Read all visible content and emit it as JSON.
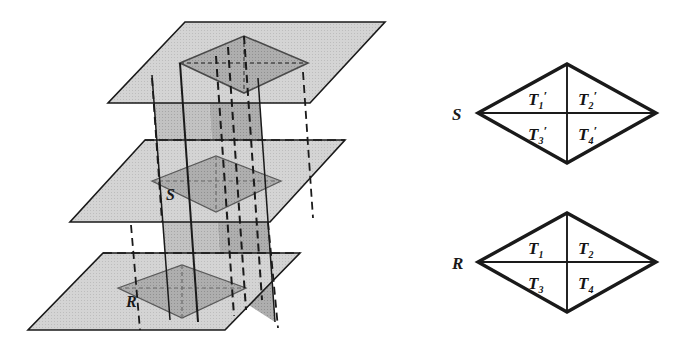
{
  "figure": {
    "colors": {
      "ink": "#1a1a1a",
      "plane_fill": "#d2d2d2",
      "prism_front_fill": "#b4b4b4",
      "prism_side_fill": "#c0c0c0",
      "rhombus_fill": "#a8a8a8",
      "rhombus_fill_dark": "#9a9a9a",
      "background": "#ffffff"
    }
  },
  "left_diagram": {
    "name": "three-parallel-planes-prism",
    "plane_labels": {
      "middle_plane_section": "S",
      "bottom_plane_section": "R"
    },
    "planes": [
      {
        "id": "top-plane",
        "label": ""
      },
      {
        "id": "middle-plane",
        "label": "S"
      },
      {
        "id": "bottom-plane",
        "label": "R"
      }
    ]
  },
  "right_diagrams": [
    {
      "name": "rhombus-s-detail",
      "vertex_label": "S",
      "regions": [
        {
          "id": "t1p",
          "base": "T",
          "sub": "1",
          "prime": "′",
          "quadrant": "top-left"
        },
        {
          "id": "t2p",
          "base": "T",
          "sub": "2",
          "prime": "′",
          "quadrant": "top-right"
        },
        {
          "id": "t3p",
          "base": "T",
          "sub": "3",
          "prime": "′",
          "quadrant": "bottom-left"
        },
        {
          "id": "t4p",
          "base": "T",
          "sub": "4",
          "prime": "′",
          "quadrant": "bottom-right"
        }
      ]
    },
    {
      "name": "rhombus-r-detail",
      "vertex_label": "R",
      "regions": [
        {
          "id": "t1",
          "base": "T",
          "sub": "1",
          "prime": "",
          "quadrant": "top-left"
        },
        {
          "id": "t2",
          "base": "T",
          "sub": "2",
          "prime": "",
          "quadrant": "top-right"
        },
        {
          "id": "t3",
          "base": "T",
          "sub": "3",
          "prime": "",
          "quadrant": "bottom-left"
        },
        {
          "id": "t4",
          "base": "T",
          "sub": "4",
          "prime": "",
          "quadrant": "bottom-right"
        }
      ]
    }
  ]
}
